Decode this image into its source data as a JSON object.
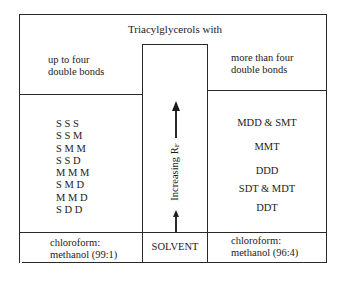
{
  "diagram": {
    "title": "Triacylglycerols with",
    "left_header": [
      "up to four",
      "double bonds"
    ],
    "right_header": [
      "more than four",
      "double bonds"
    ],
    "left_items": [
      "S S S",
      "S S M",
      "S M M",
      "S S D",
      "M M M",
      "S M D",
      "M M D",
      "S D D"
    ],
    "right_items": [
      "MDD & SMT",
      "MMT",
      "DDD",
      "SDT & MDT",
      "DDT"
    ],
    "axis_label": "Increasing R",
    "axis_label_subscript": "F",
    "arrow_direction": "up",
    "left_solvent": [
      "chloroform:",
      "methanol (99:1)"
    ],
    "center_solvent": "SOLVENT",
    "right_solvent": [
      "chloroform:",
      "methanol (96:4)"
    ],
    "caption": "",
    "colors": {
      "line": "#2a2a2a",
      "text": "#1a1a1a",
      "background": "#ffffff"
    }
  }
}
